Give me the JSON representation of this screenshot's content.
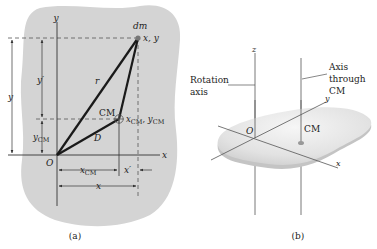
{
  "figure_a": {
    "caption": "(a)",
    "axis_x": "x",
    "axis_y": "y",
    "origin": "O",
    "mass_element": "dm",
    "mass_coords": "x, y",
    "cm_label": "CM",
    "cm_coords_x": "x",
    "cm_coords_sub": "CM",
    "cm_coords_sep": ", ",
    "cm_coords_y": "y",
    "r_label": "r",
    "d_label": "D",
    "dim_y": "y",
    "dim_y_prime": "y′",
    "dim_ycm": "y",
    "dim_ycm_sub": "CM",
    "dim_xcm": "x",
    "dim_xcm_sub": "CM",
    "dim_x_prime": "x′",
    "dim_x": "x"
  },
  "figure_b": {
    "caption": "(b)",
    "axis_z": "z",
    "axis_x": "x",
    "axis_y": "y",
    "origin": "O",
    "cm_label": "CM",
    "rotation_axis_line1": "Rotation",
    "rotation_axis_line2": "axis",
    "cm_axis_line1": "Axis",
    "cm_axis_line2": "through",
    "cm_axis_line3": "CM"
  },
  "colors": {
    "blob_fill": "#d4d4d4",
    "line": "#1a1a1a",
    "thin_line": "#444444",
    "plate_top": "#e8e8e8",
    "plate_edge": "#c8c8c8"
  }
}
